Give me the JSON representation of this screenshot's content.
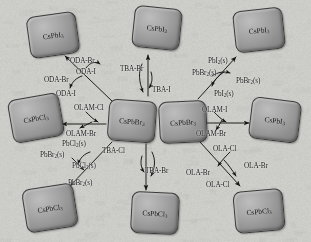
{
  "figure": {
    "type": "reaction-scheme",
    "background_color": "#cdcdc9",
    "crystal_color": "#9a9a9a",
    "crystal_border_color": "#3a3a3a",
    "text_color": "#141414"
  },
  "crystals": [
    {
      "id": "tl",
      "formula": "CsPbI",
      "sub": "3",
      "x": 28,
      "y": 14,
      "w": 50,
      "h": 42,
      "rot": -8
    },
    {
      "id": "tc",
      "formula": "CsPbI",
      "sub": "3",
      "x": 133,
      "y": 7,
      "w": 48,
      "h": 42,
      "rot": 6
    },
    {
      "id": "tr",
      "formula": "CsPbI",
      "sub": "3",
      "x": 234,
      "y": 9,
      "w": 50,
      "h": 42,
      "rot": -6
    },
    {
      "id": "ml",
      "formula": "CsPbCl",
      "sub": "3",
      "x": 10,
      "y": 96,
      "w": 52,
      "h": 44,
      "rot": -10
    },
    {
      "id": "cl",
      "formula": "CsPbBr",
      "sub": "3",
      "x": 108,
      "y": 100,
      "w": 48,
      "h": 42,
      "rot": 4
    },
    {
      "id": "cr",
      "formula": "CsPbBr",
      "sub": "3",
      "x": 159,
      "y": 101,
      "w": 48,
      "h": 42,
      "rot": -3
    },
    {
      "id": "mr",
      "formula": "CsPbI",
      "sub": "3",
      "x": 250,
      "y": 99,
      "w": 50,
      "h": 42,
      "rot": 7
    },
    {
      "id": "bl",
      "formula": "CsPbCl",
      "sub": "3",
      "x": 24,
      "y": 186,
      "w": 52,
      "h": 44,
      "rot": -9
    },
    {
      "id": "bc",
      "formula": "CsPbCl",
      "sub": "3",
      "x": 131,
      "y": 192,
      "w": 48,
      "h": 42,
      "rot": 3
    },
    {
      "id": "br",
      "formula": "CsPbCl",
      "sub": "3",
      "x": 234,
      "y": 190,
      "w": 50,
      "h": 42,
      "rot": -5
    }
  ],
  "labels": [
    {
      "id": "l01",
      "text": "ODA-Br",
      "sub": "",
      "x": 70,
      "y": 58
    },
    {
      "id": "l02",
      "text": "ODA-I",
      "sub": "",
      "x": 76,
      "y": 69
    },
    {
      "id": "l03",
      "text": "ODA-Br",
      "sub": "",
      "x": 44,
      "y": 77
    },
    {
      "id": "l04",
      "text": "ODA-I",
      "sub": "",
      "x": 56,
      "y": 91
    },
    {
      "id": "l05",
      "text": "TBA-Br",
      "sub": "",
      "x": 120,
      "y": 66
    },
    {
      "id": "l06",
      "text": "TBA-I",
      "sub": "",
      "x": 152,
      "y": 87
    },
    {
      "id": "l07",
      "text": "PbI",
      "sub": "2",
      "suffix": "(s)",
      "x": 208,
      "y": 58
    },
    {
      "id": "l08",
      "text": "PbBr",
      "sub": "2",
      "suffix": "(s)",
      "x": 192,
      "y": 70
    },
    {
      "id": "l09",
      "text": "PbBr",
      "sub": "2",
      "suffix": "(s)",
      "x": 236,
      "y": 78
    },
    {
      "id": "l10",
      "text": "PbI",
      "sub": "2",
      "suffix": "(s)",
      "x": 214,
      "y": 91
    },
    {
      "id": "l11",
      "text": "OLAM-Cl",
      "sub": "",
      "x": 74,
      "y": 105
    },
    {
      "id": "l12",
      "text": "OLAM-Br",
      "sub": "",
      "x": 66,
      "y": 131
    },
    {
      "id": "l13",
      "text": "OLAM-I",
      "sub": "",
      "x": 202,
      "y": 107
    },
    {
      "id": "l14",
      "text": "OLAM-Br",
      "sub": "",
      "x": 196,
      "y": 131
    },
    {
      "id": "l15",
      "text": "PbCl",
      "sub": "2",
      "suffix": "(s)",
      "x": 62,
      "y": 141
    },
    {
      "id": "l16",
      "text": "PbBr",
      "sub": "2",
      "suffix": "(s)",
      "x": 40,
      "y": 152
    },
    {
      "id": "l17",
      "text": "PbCl",
      "sub": "2",
      "suffix": "(s)",
      "x": 72,
      "y": 163
    },
    {
      "id": "l18",
      "text": "PbBr",
      "sub": "2",
      "suffix": "(s)",
      "x": 68,
      "y": 180
    },
    {
      "id": "l19",
      "text": "TBA-Cl",
      "sub": "",
      "x": 102,
      "y": 148
    },
    {
      "id": "l20",
      "text": "TBA-Br",
      "sub": "",
      "x": 145,
      "y": 168
    },
    {
      "id": "l21",
      "text": "OLA-Cl",
      "sub": "",
      "x": 213,
      "y": 146
    },
    {
      "id": "l22",
      "text": "OLA-Br",
      "sub": "",
      "x": 244,
      "y": 163
    },
    {
      "id": "l23",
      "text": "OLA-Br",
      "sub": "",
      "x": 186,
      "y": 170
    },
    {
      "id": "l24",
      "text": "OLA-Cl",
      "sub": "",
      "x": 206,
      "y": 182
    }
  ],
  "arrows": {
    "note": "Each pathway is a pair of crossing curved arrows (forward halide in, reverse halide out)."
  }
}
